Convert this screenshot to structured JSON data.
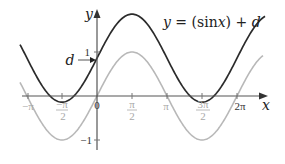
{
  "figure": {
    "equation_label": "y = (sin x) + d",
    "equation_parts": {
      "y": "y",
      "eq": " = (sin",
      "x": "x",
      "close": ") + ",
      "d": "d"
    },
    "axis_labels": {
      "x": "x",
      "y": "y"
    },
    "shift_label": "d",
    "y_ticks": [
      {
        "label": "1",
        "value": 1
      },
      {
        "label": "−1",
        "value": -1
      }
    ],
    "x_ticks": [
      {
        "label": "−π",
        "value": "-pi",
        "style": "light"
      },
      {
        "label_num": "−π",
        "label_den": "2",
        "value": "-pi/2",
        "style": "light"
      },
      {
        "label": "0",
        "value": "0",
        "style": "dark"
      },
      {
        "label_num": "π",
        "label_den": "2",
        "value": "pi/2",
        "style": "light"
      },
      {
        "label": "π",
        "value": "pi",
        "style": "light"
      },
      {
        "label_num": "3π",
        "label_den": "2",
        "value": "3pi/2",
        "style": "light"
      },
      {
        "label": "2π",
        "value": "2pi",
        "style": "dark"
      }
    ],
    "curves": [
      {
        "name": "sin x + d",
        "color": "#2b2b2b",
        "shift": 0.86
      },
      {
        "name": "sin x",
        "color": "#b8b8b8",
        "shift": 0
      }
    ],
    "colors": {
      "axis": "#555555",
      "dark_curve": "#2b2b2b",
      "light_curve": "#b8b8b8",
      "light_label": "#a8a8a8",
      "dark_label": "#333333"
    }
  }
}
